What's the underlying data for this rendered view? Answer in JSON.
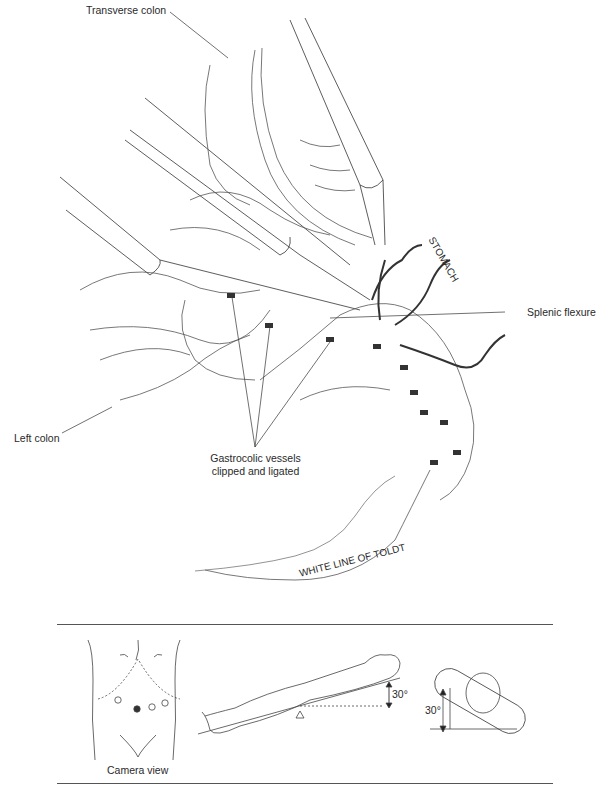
{
  "figure": {
    "labels": {
      "transverse_colon": "Transverse colon",
      "stomach": "STOMACH",
      "splenic_flexure": "Splenic flexure",
      "left_colon": "Left colon",
      "gastrocolic_line1": "Gastrocolic vessels",
      "gastrocolic_line2": "clipped and ligated",
      "white_line": "WHITE LINE OF TOLDT"
    }
  },
  "inset_panel": {
    "camera_view_label": "Camera view",
    "tilt_angle_side": "30°",
    "tilt_angle_end": "30°",
    "port_count": 4
  }
}
